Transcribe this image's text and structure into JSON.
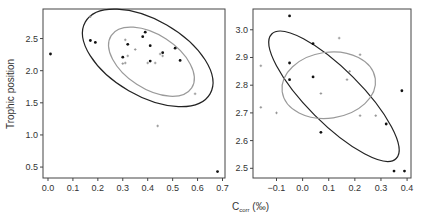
{
  "figure": {
    "ylabel": "Trophic position",
    "xlabel_main": "C",
    "xlabel_sub": "corr",
    "xlabel_unit": "(‰)"
  },
  "colors": {
    "axis": "#444444",
    "black_series": "#111111",
    "grey_series": "#8a8a8a",
    "black_ellipse": "#222222",
    "grey_ellipse": "#9a9a9a"
  },
  "chart_data": [
    {
      "type": "scatter",
      "panel": "left",
      "title": "",
      "xlabel": "",
      "ylabel": "Trophic position",
      "xlim": [
        -0.02,
        0.71
      ],
      "ylim": [
        0.33,
        2.96
      ],
      "xticks": [
        0.0,
        0.1,
        0.2,
        0.3,
        0.4,
        0.5,
        0.6,
        0.7
      ],
      "xtick_labels": [
        "0.0",
        "0.1",
        "0.2",
        "0.3",
        "0.4",
        "0.5",
        "0.6",
        "0.7"
      ],
      "yticks": [
        0.5,
        1.0,
        1.5,
        2.0,
        2.5
      ],
      "ytick_labels": [
        "0.5",
        "1.0",
        "1.5",
        "2.0",
        "2.5"
      ],
      "grid": false,
      "series": [
        {
          "name": "black",
          "marker": "dot",
          "points": [
            [
              0.01,
              2.26
            ],
            [
              0.17,
              2.47
            ],
            [
              0.19,
              2.44
            ],
            [
              0.39,
              2.6
            ],
            [
              0.38,
              2.53
            ],
            [
              0.32,
              2.41
            ],
            [
              0.41,
              2.39
            ],
            [
              0.3,
              2.21
            ],
            [
              0.41,
              2.15
            ],
            [
              0.46,
              2.28
            ],
            [
              0.51,
              2.35
            ],
            [
              0.53,
              2.16
            ],
            [
              0.68,
              0.43
            ]
          ]
        },
        {
          "name": "grey",
          "marker": "plus",
          "points": [
            [
              0.17,
              2.84
            ],
            [
              0.31,
              2.48
            ],
            [
              0.35,
              2.33
            ],
            [
              0.32,
              2.23
            ],
            [
              0.3,
              2.11
            ],
            [
              0.31,
              2.12
            ],
            [
              0.4,
              2.12
            ],
            [
              0.43,
              2.12
            ],
            [
              0.45,
              2.26
            ],
            [
              0.46,
              2.23
            ],
            [
              0.59,
              1.64
            ],
            [
              0.44,
              1.14
            ]
          ]
        }
      ],
      "ellipses": [
        {
          "name": "black",
          "cx": 0.4,
          "cy": 2.2,
          "rx_px": 72,
          "ry_px": 38,
          "rotation_deg": 30
        },
        {
          "name": "grey",
          "cx": 0.415,
          "cy": 2.14,
          "rx_px": 48,
          "ry_px": 27,
          "rotation_deg": 33
        }
      ]
    },
    {
      "type": "scatter",
      "panel": "right",
      "title": "",
      "xlabel": "Ccorr (‰)",
      "ylabel": "",
      "xlim": [
        -0.19,
        0.415
      ],
      "ylim": [
        2.465,
        3.075
      ],
      "xticks": [
        -0.1,
        0.0,
        0.1,
        0.2,
        0.3,
        0.4
      ],
      "xtick_labels": [
        "−0.1",
        "0.0",
        "0.1",
        "0.2",
        "0.3",
        "0.4"
      ],
      "yticks": [
        2.5,
        2.6,
        2.7,
        2.8,
        2.9,
        3.0
      ],
      "ytick_labels": [
        "2.5",
        "2.6",
        "2.7",
        "2.8",
        "2.9",
        "3.0"
      ],
      "grid": false,
      "series": [
        {
          "name": "black",
          "marker": "dot",
          "points": [
            [
              -0.05,
              3.05
            ],
            [
              0.04,
              2.95
            ],
            [
              -0.05,
              2.88
            ],
            [
              -0.05,
              2.82
            ],
            [
              0.04,
              2.83
            ],
            [
              0.07,
              2.63
            ],
            [
              0.32,
              2.66
            ],
            [
              0.38,
              2.78
            ],
            [
              0.35,
              2.49
            ],
            [
              0.39,
              2.49
            ]
          ]
        },
        {
          "name": "grey",
          "marker": "plus",
          "points": [
            [
              0.14,
              2.97
            ],
            [
              0.22,
              2.91
            ],
            [
              -0.16,
              2.87
            ],
            [
              0.18,
              2.85
            ],
            [
              0.17,
              2.82
            ],
            [
              0.07,
              2.77
            ],
            [
              -0.16,
              2.72
            ],
            [
              -0.1,
              2.7
            ],
            [
              0.22,
              2.69
            ],
            [
              0.28,
              2.69
            ]
          ]
        }
      ],
      "ellipses": [
        {
          "name": "black",
          "cx": 0.12,
          "cy": 2.76,
          "rx_px": 88,
          "ry_px": 27,
          "rotation_deg": 45
        },
        {
          "name": "grey",
          "cx": 0.1,
          "cy": 2.8,
          "rx_px": 47,
          "ry_px": 33,
          "rotation_deg": -8
        }
      ]
    }
  ]
}
